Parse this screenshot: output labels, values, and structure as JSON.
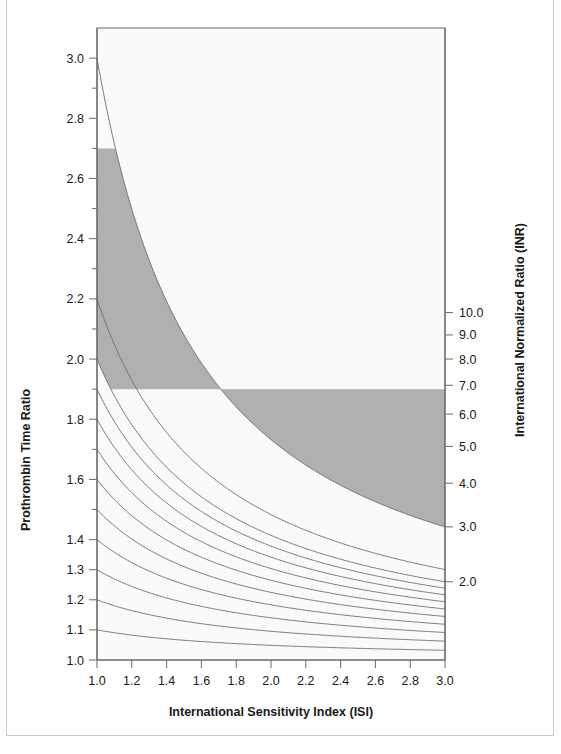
{
  "chart_data": {
    "type": "line",
    "title": "",
    "subtitle": "",
    "xlabel": "International Sensitivity Index (ISI)",
    "ylabel": "Prothrombin Time Ratio",
    "y2label": "International Normalized Ratio (INR)",
    "xlim": [
      1.0,
      3.0
    ],
    "ylim": [
      1.0,
      3.1
    ],
    "grid": false,
    "legend_position": "none",
    "relationship": "INR = PTR ^ ISI  (each line is a constant INR isopleth)",
    "x_ticks": [
      1.0,
      1.2,
      1.4,
      1.6,
      1.8,
      2.0,
      2.2,
      2.4,
      2.6,
      2.8,
      3.0
    ],
    "x_tick_labels": [
      "1.0",
      "1.2",
      "1.4",
      "1.6",
      "1.8",
      "2.0",
      "2.2",
      "2.4",
      "2.6",
      "2.8",
      "3.0"
    ],
    "y_ticks": [
      1.0,
      1.1,
      1.2,
      1.3,
      1.4,
      1.5,
      1.6,
      1.7,
      1.8,
      1.9,
      2.0,
      2.1,
      2.2,
      2.3,
      2.4,
      2.5,
      2.6,
      2.7,
      2.8,
      2.9,
      3.0
    ],
    "y_tick_labels_shown": [
      "1.0",
      "1.1",
      "1.2",
      "1.3",
      "1.4",
      "1.6",
      "1.8",
      "2.0",
      "2.2",
      "2.4",
      "2.6",
      "2.8",
      "3.0"
    ],
    "y2_tick_values": [
      2.0,
      3.0,
      4.0,
      5.0,
      6.0,
      7.0,
      8.0,
      9.0,
      10.0
    ],
    "y2_tick_labels": [
      "2.0",
      "3.0",
      "4.0",
      "5.0",
      "6.0",
      "7.0",
      "8.0",
      "9.0",
      "10.0"
    ],
    "series": [
      {
        "name": "INR 1.1",
        "inr": 1.1,
        "ptr_at_isi_1.0": 1.1,
        "ptr_at_isi_3.0": 1.032
      },
      {
        "name": "INR 1.2",
        "inr": 1.2,
        "ptr_at_isi_1.0": 1.2,
        "ptr_at_isi_3.0": 1.063
      },
      {
        "name": "INR 1.3",
        "inr": 1.3,
        "ptr_at_isi_1.0": 1.3,
        "ptr_at_isi_3.0": 1.091
      },
      {
        "name": "INR 1.4",
        "inr": 1.4,
        "ptr_at_isi_1.0": 1.4,
        "ptr_at_isi_3.0": 1.119
      },
      {
        "name": "INR 1.5",
        "inr": 1.5,
        "ptr_at_isi_1.0": 1.5,
        "ptr_at_isi_3.0": 1.145
      },
      {
        "name": "INR 1.6",
        "inr": 1.6,
        "ptr_at_isi_1.0": 1.6,
        "ptr_at_isi_3.0": 1.17
      },
      {
        "name": "INR 1.7",
        "inr": 1.7,
        "ptr_at_isi_1.0": 1.7,
        "ptr_at_isi_3.0": 1.193
      },
      {
        "name": "INR 1.8",
        "inr": 1.8,
        "ptr_at_isi_1.0": 1.8,
        "ptr_at_isi_3.0": 1.216
      },
      {
        "name": "INR 1.9",
        "inr": 1.9,
        "ptr_at_isi_1.0": 1.9,
        "ptr_at_isi_3.0": 1.239
      },
      {
        "name": "INR 2.0",
        "inr": 2.0,
        "ptr_at_isi_1.0": 2.0,
        "ptr_at_isi_3.0": 1.26
      },
      {
        "name": "INR 2.2",
        "inr": 2.2,
        "ptr_at_isi_1.0": 2.2,
        "ptr_at_isi_3.0": 1.301
      }
    ],
    "shaded_band": {
      "label": "therapeutic range",
      "color": "#b0b0b0",
      "lower_inr": 2.0,
      "upper_inr": 3.0,
      "note": "band is bounded below by the INR 2.0 isopleth and above by the INR 3.0 isopleth, clipped to the PTR window 1.9 - 2.7"
    },
    "reversed_lines_note": "lines are drawn for constant INR; higher INR lines start higher on the left axis"
  },
  "axes": {
    "left": {
      "title": "Prothrombin Time Ratio",
      "labels": [
        "3.0",
        "2.8",
        "2.6",
        "2.4",
        "2.2",
        "2.0",
        "1.8",
        "1.6",
        "1.4",
        "1.3",
        "1.2",
        "1.1",
        "1.0"
      ]
    },
    "right": {
      "title": "International Normalized Ratio (INR)",
      "labels": [
        "10.0",
        "9.0",
        "8.0",
        "7.0",
        "6.0",
        "5.0",
        "4.0",
        "3.0",
        "2.0"
      ]
    },
    "bottom": {
      "title": "International Sensitivity Index (ISI)",
      "labels": [
        "1.0",
        "1.2",
        "1.4",
        "1.6",
        "1.8",
        "2.0",
        "2.2",
        "2.4",
        "2.6",
        "2.8",
        "3.0"
      ]
    }
  },
  "colors": {
    "background": "#ffffff",
    "plot_background": "#fafafa",
    "line": "#6e6e6e",
    "band": "#b0b0b0",
    "axis": "#6a6a6a",
    "text": "#1a1a1a",
    "page_border": "#c9c9c9"
  }
}
